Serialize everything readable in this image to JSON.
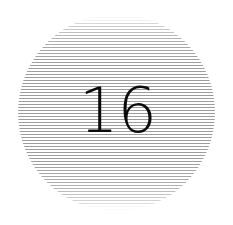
{
  "canvas": {
    "width": 233,
    "height": 225,
    "background_color": "#ffffff"
  },
  "graphic": {
    "name": "striped-circle-badge",
    "shape": "circle",
    "center_x": 116,
    "center_y": 112,
    "diameter": 197,
    "radius": 98,
    "fill_pattern": "horizontal-stripes",
    "stripe_color": "#9c9c9c",
    "stripe_gap_color": "#ffffff",
    "stripe_thickness": 1,
    "stripe_period": 3,
    "stripe_count": 66,
    "edge_fade": "stripes fade to near-white at top and bottom of the circle"
  },
  "label": {
    "text": "16",
    "color": "#0b0b0b",
    "font_size": 62,
    "font_weight": "light",
    "center_x": 117,
    "center_y": 112,
    "cap_height": 43,
    "text_width": 47
  }
}
